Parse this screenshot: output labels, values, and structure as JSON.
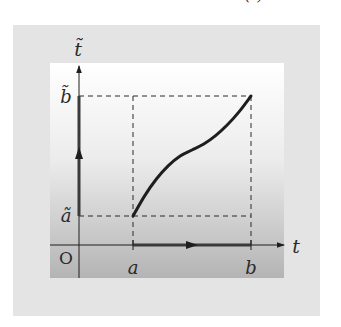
{
  "diagram": {
    "colors": {
      "outer_frame": "#e4e4e4",
      "panel_top": "#ffffff",
      "panel_bottom": "#b4b4b4",
      "ink": "#1e1e1e",
      "axis_highlight": "#3a3a3a"
    },
    "labels": {
      "vertical_axis": "t̃",
      "horizontal_axis": "t",
      "origin": "O",
      "a": "a",
      "b": "b",
      "a_tilde": "ã",
      "b_tilde": "b̃",
      "curve": "t̃=σ (t)"
    },
    "domain": {
      "a": 1,
      "b": 2
    },
    "range": {
      "a_tilde": 1,
      "b_tilde": 2
    },
    "curve_points": [
      [
        1.0,
        1.0
      ],
      [
        1.1,
        1.17
      ],
      [
        1.2,
        1.31
      ],
      [
        1.3,
        1.42
      ],
      [
        1.4,
        1.5
      ],
      [
        1.5,
        1.55
      ],
      [
        1.6,
        1.6
      ],
      [
        1.7,
        1.67
      ],
      [
        1.8,
        1.76
      ],
      [
        1.9,
        1.87
      ],
      [
        2.0,
        2.0
      ]
    ]
  }
}
